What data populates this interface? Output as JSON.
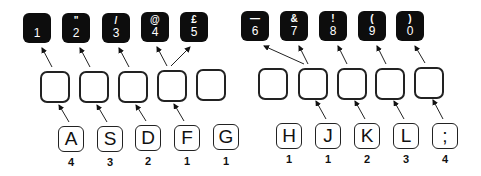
{
  "top_row": [
    {
      "symbol": "",
      "number": "1",
      "x": 23,
      "y": 13
    },
    {
      "symbol": "\"",
      "number": "2",
      "x": 62,
      "y": 13
    },
    {
      "symbol": "/",
      "number": "3",
      "x": 102,
      "y": 13
    },
    {
      "symbol": "@",
      "number": "4",
      "x": 141,
      "y": 12
    },
    {
      "symbol": "£",
      "number": "5",
      "x": 180,
      "y": 12
    },
    {
      "symbol": "—",
      "number": "6",
      "x": 241,
      "y": 11
    },
    {
      "symbol": "&",
      "number": "7",
      "x": 280,
      "y": 11
    },
    {
      "symbol": "!",
      "number": "8",
      "x": 319,
      "y": 11
    },
    {
      "symbol": "(",
      "number": "9",
      "x": 358,
      "y": 11
    },
    {
      "symbol": ")",
      "number": "0",
      "x": 396,
      "y": 11
    }
  ],
  "home_row": [
    {
      "letter": "A",
      "finger": "4"
    },
    {
      "letter": "S",
      "finger": "3"
    },
    {
      "letter": "D",
      "finger": "2"
    },
    {
      "letter": "F",
      "finger": "1"
    },
    {
      "letter": "G",
      "finger": "1"
    },
    {
      "letter": "H",
      "finger": "1"
    },
    {
      "letter": "J",
      "finger": "1"
    },
    {
      "letter": "K",
      "finger": "2"
    },
    {
      "letter": "L",
      "finger": "3"
    },
    {
      "letter": ";",
      "finger": "4"
    }
  ],
  "colors": {
    "key_fill": "#0d0d0d",
    "outline": "#222222",
    "background": "#ffffff"
  }
}
